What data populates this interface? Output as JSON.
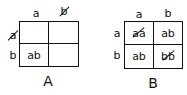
{
  "diagrams": [
    {
      "caption": "A",
      "column_labels": [
        "a",
        "b"
      ],
      "row_labels": [
        "a",
        "b"
      ],
      "column_label_crossed": [
        false,
        true
      ],
      "row_label_crossed": [
        true,
        false
      ],
      "cells": [
        [
          "",
          ""
        ],
        [
          "ab",
          ""
        ]
      ]
    },
    {
      "caption": "B",
      "column_labels": [
        "a",
        "b"
      ],
      "row_labels": [
        "a",
        "b"
      ],
      "cells": [
        [
          "aa",
          "ab"
        ],
        [
          "ab",
          "bb"
        ]
      ],
      "cells_crossed": [
        [
          true,
          false
        ],
        [
          false,
          true
        ]
      ]
    }
  ]
}
